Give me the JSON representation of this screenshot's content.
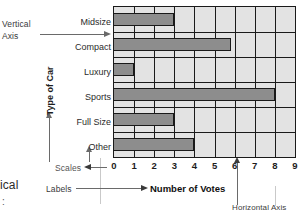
{
  "annotations": {
    "vertical_axis": "Vertical\nAxis",
    "vertical_axis_line1": "Vertical",
    "vertical_axis_line2": "Axis",
    "y_axis_title": "Type of Car",
    "scales": "Scales",
    "labels": "Labels",
    "horizontal_axis": "Horizontal Axis",
    "page_margin_text": "ical",
    "page_margin_dots": ":"
  },
  "chart_data": {
    "type": "bar",
    "orientation": "horizontal",
    "title": "",
    "xlabel": "Number of Votes",
    "ylabel": "Type of Car",
    "categories": [
      "Midsize",
      "Compact",
      "Luxury",
      "Sports",
      "Full Size",
      "Other"
    ],
    "values": [
      3,
      5.8,
      1,
      8,
      3,
      4
    ],
    "xlim": [
      0,
      9
    ],
    "xticks": [
      0,
      1,
      2,
      3,
      4,
      5,
      6,
      7,
      8,
      9
    ],
    "ticklabels": [
      "0",
      "1",
      "2",
      "3",
      "4",
      "5",
      "6",
      "7",
      "8",
      "9"
    ],
    "grid": "vertical",
    "legend": "none",
    "bar_color": "#8d8d8d",
    "plot_background": "#e3e3e3",
    "axis_color": "#1a1a1a"
  }
}
